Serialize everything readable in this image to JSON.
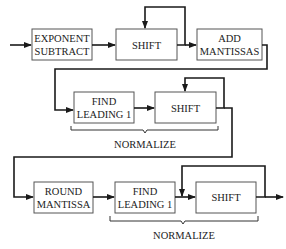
{
  "diagram": {
    "type": "flowchart",
    "rows": [
      {
        "blocks": [
          {
            "id": "exponent-subtract",
            "line1": "EXPONENT",
            "line2": "SUBTRACT"
          },
          {
            "id": "shift-1",
            "line1": "SHIFT",
            "line2": ""
          },
          {
            "id": "add-mantissas",
            "line1": "ADD",
            "line2": "MANTISSAS"
          }
        ]
      },
      {
        "blocks": [
          {
            "id": "find-leading-1-a",
            "line1": "FIND",
            "line2": "LEADING 1"
          },
          {
            "id": "shift-2",
            "line1": "SHIFT",
            "line2": ""
          }
        ],
        "group_label": "NORMALIZE"
      },
      {
        "blocks": [
          {
            "id": "round-mantissa",
            "line1": "ROUND",
            "line2": "MANTISSA"
          },
          {
            "id": "find-leading-1-b",
            "line1": "FIND",
            "line2": "LEADING 1"
          },
          {
            "id": "shift-3",
            "line1": "SHIFT",
            "line2": ""
          }
        ],
        "group_label": "NORMALIZE"
      }
    ],
    "edges": [
      [
        "input",
        "exponent-subtract"
      ],
      [
        "exponent-subtract",
        "shift-1"
      ],
      [
        "shift-1",
        "shift-1 (feedback)"
      ],
      [
        "shift-1",
        "add-mantissas"
      ],
      [
        "add-mantissas",
        "find-leading-1-a"
      ],
      [
        "find-leading-1-a",
        "shift-2"
      ],
      [
        "shift-2",
        "shift-2 (feedback)"
      ],
      [
        "shift-2",
        "round-mantissa"
      ],
      [
        "round-mantissa",
        "find-leading-1-b"
      ],
      [
        "find-leading-1-b",
        "shift-3"
      ],
      [
        "shift-3",
        "shift-3 (feedback)"
      ],
      [
        "shift-3",
        "output"
      ]
    ]
  }
}
